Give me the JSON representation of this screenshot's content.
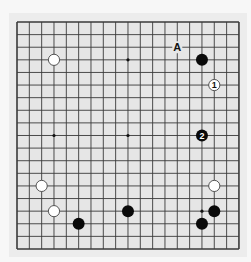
{
  "board": {
    "size": 19,
    "origin_x": 17,
    "origin_y": 22,
    "step_x": 12.33,
    "step_y": 12.61,
    "board_color": "#e6e6e6",
    "line_color": "#3a3a3a",
    "border_width": 1.6,
    "line_width": 0.9,
    "star_points": [
      [
        3,
        3
      ],
      [
        9,
        3
      ],
      [
        15,
        3
      ],
      [
        3,
        9
      ],
      [
        9,
        9
      ],
      [
        15,
        9
      ],
      [
        3,
        15
      ],
      [
        9,
        15
      ],
      [
        15,
        15
      ]
    ]
  },
  "stones": [
    {
      "color": "white",
      "col": 3,
      "row": 3,
      "label": ""
    },
    {
      "color": "black",
      "col": 15,
      "row": 3,
      "label": ""
    },
    {
      "color": "white",
      "col": 16,
      "row": 5,
      "label": "1"
    },
    {
      "color": "black",
      "col": 15,
      "row": 9,
      "label": "2"
    },
    {
      "color": "white",
      "col": 2,
      "row": 13,
      "label": ""
    },
    {
      "color": "white",
      "col": 16,
      "row": 13,
      "label": ""
    },
    {
      "color": "white",
      "col": 3,
      "row": 15,
      "label": ""
    },
    {
      "color": "black",
      "col": 9,
      "row": 15,
      "label": ""
    },
    {
      "color": "black",
      "col": 16,
      "row": 15,
      "label": ""
    },
    {
      "color": "black",
      "col": 5,
      "row": 16,
      "label": ""
    },
    {
      "color": "black",
      "col": 15,
      "row": 16,
      "label": ""
    }
  ],
  "markers": [
    {
      "text": "A",
      "col": 13,
      "row": 2
    }
  ]
}
